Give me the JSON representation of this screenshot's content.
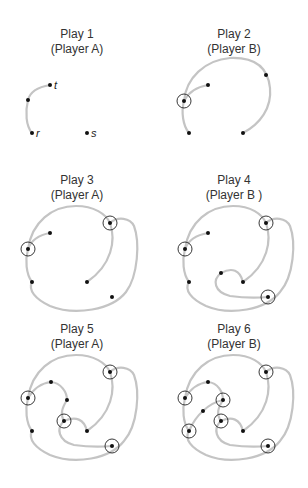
{
  "figure": {
    "panels": [
      {
        "id": 1,
        "title": "Play 1",
        "subtitle": "(Player A)",
        "labels": {
          "t": "t",
          "r": "r",
          "s": "s"
        }
      },
      {
        "id": 2,
        "title": "Play 2",
        "subtitle": "(Player B)"
      },
      {
        "id": 3,
        "title": "Play 3",
        "subtitle": "(Player A)"
      },
      {
        "id": 4,
        "title": "Play 4",
        "subtitle": "(Player B )"
      },
      {
        "id": 5,
        "title": "Play 5",
        "subtitle": "(Player A)"
      },
      {
        "id": 6,
        "title": "Play 6",
        "subtitle": "(Player B)"
      }
    ],
    "colors": {
      "curve": "#c4c4c4",
      "dot": "#111111",
      "ring": "#222222",
      "text": "#333333"
    }
  }
}
